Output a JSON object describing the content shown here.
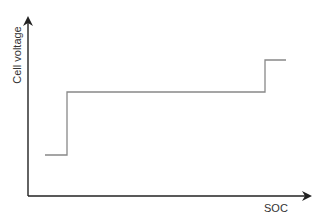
{
  "chart_data": {
    "type": "line",
    "title": "",
    "xlabel": "SOC",
    "ylabel": "Cell voltage",
    "grid": false,
    "legend": null,
    "ticks": {
      "x": [],
      "y": []
    },
    "series": [
      {
        "name": "Cell voltage vs SOC (step profile)",
        "points_px": [
          [
            45,
            155
          ],
          [
            67,
            155
          ],
          [
            67,
            92
          ],
          [
            265,
            92
          ],
          [
            265,
            60
          ],
          [
            286,
            60
          ]
        ],
        "description": "Low plateau at low SOC, long middle plateau, step up to high plateau near full SOC"
      }
    ],
    "axes": {
      "x_arrow": true,
      "y_arrow": true
    },
    "colors": {
      "axis": "#222222",
      "line": "#888888"
    }
  }
}
